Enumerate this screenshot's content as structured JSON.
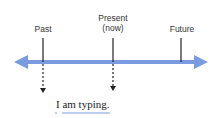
{
  "timeline": {
    "labels": {
      "past": "Past",
      "present_line1": "Present",
      "present_line2": "(now)",
      "future": "Future"
    },
    "axis_color": "#7a9be0",
    "tick_color": "#222222"
  },
  "example": {
    "sentence": "I am typing.",
    "underline_color": "#7a9be0"
  }
}
